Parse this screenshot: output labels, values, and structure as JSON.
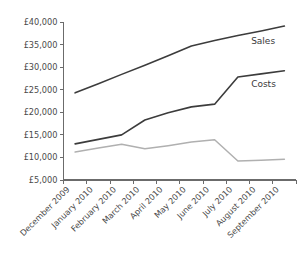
{
  "chart_data": {
    "type": "line",
    "title": "",
    "xlabel": "",
    "ylabel": "",
    "ylim": [
      5000,
      40000
    ],
    "ytick_values": [
      5000,
      10000,
      15000,
      20000,
      25000,
      30000,
      35000,
      40000
    ],
    "ytick_labels": [
      "£5,000",
      "£10,000",
      "£15,000",
      "£20,000",
      "£25,000",
      "£30,000",
      "£35,000",
      "£40,000"
    ],
    "categories": [
      "December 2009",
      "January 2010",
      "February 2010",
      "March 2010",
      "April 2010",
      "May 2010",
      "June 2010",
      "July 2010",
      "August 2010",
      "September 2010"
    ],
    "grid": false,
    "legend_position": "inline-right",
    "series": [
      {
        "name": "Sales",
        "color": "#3c3c3c",
        "values": [
          24300,
          26300,
          28400,
          30400,
          32500,
          34700,
          35900,
          37000,
          38000,
          39100
        ]
      },
      {
        "name": "Costs",
        "color": "#3c3c3c",
        "values": [
          13000,
          14000,
          15000,
          18300,
          19900,
          21200,
          21800,
          27800,
          28500,
          29200
        ]
      },
      {
        "name": "",
        "color": "#b0b0b0",
        "values": [
          11200,
          12100,
          12900,
          11900,
          12600,
          13400,
          13900,
          9200,
          9400,
          9600
        ]
      }
    ]
  },
  "labels": {
    "sales": "Sales",
    "costs": "Costs"
  }
}
